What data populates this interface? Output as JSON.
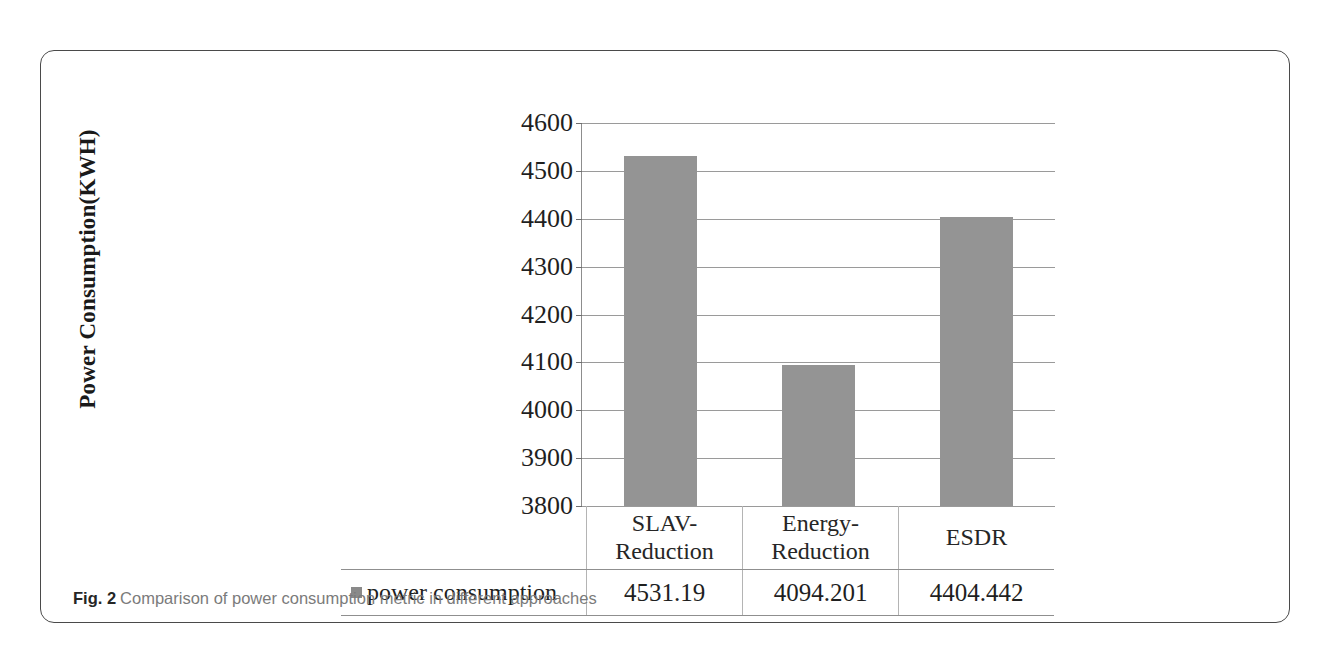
{
  "caption": {
    "label": "Fig. 2",
    "text": "Comparison of power consumption metric in different approaches"
  },
  "chart_data": {
    "type": "bar",
    "title": "",
    "xlabel": "",
    "ylabel": "Power Consumption(KWH)",
    "categories": [
      "SLAV-Reduction",
      "Energy-Reduction",
      "ESDR"
    ],
    "series": [
      {
        "name": "power consumption",
        "values": [
          4531.19,
          4094.201,
          4404.442
        ]
      }
    ],
    "values": [
      4531.19,
      4094.201,
      4404.442
    ],
    "value_labels": [
      "4531.19",
      "4094.201",
      "4404.442"
    ],
    "ylim": [
      3800,
      4600
    ],
    "ytick_labels": [
      "4600",
      "4500",
      "4400",
      "4300",
      "4200",
      "4100",
      "4000",
      "3900",
      "3800"
    ],
    "ytick_values": [
      4600,
      4500,
      4400,
      4300,
      4200,
      4100,
      4000,
      3900,
      3800
    ],
    "grid": true,
    "legend_position": "table-row",
    "bar_color": "#949494",
    "gridline_color": "#9a9a9a"
  },
  "table": {
    "legend_label": "power consumption",
    "headers": [
      {
        "line1": "SLAV-",
        "line2": "Reduction"
      },
      {
        "line1": "Energy-",
        "line2": "Reduction"
      },
      {
        "line1": "ESDR",
        "line2": ""
      }
    ],
    "values": [
      "4531.19",
      "4094.201",
      "4404.442"
    ]
  }
}
